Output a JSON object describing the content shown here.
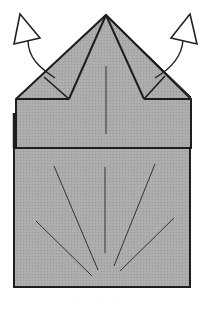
{
  "diagram": {
    "title": "",
    "colors": {
      "paper": "#a9a9a9",
      "outline": "#1e1e1e",
      "crease": "#333333",
      "arrow_fill": "#ffffff",
      "background": "#ffffff"
    },
    "elements": {
      "apex": [
        106,
        15
      ],
      "upper_band": {
        "x1": 16,
        "x2": 191,
        "y1": 99,
        "y2": 148
      },
      "lower_body": {
        "x1": 14,
        "x2": 190,
        "y1": 148,
        "y2": 287
      },
      "left_flap_fold_point": [
        69,
        99
      ],
      "right_flap_fold_point": [
        144,
        99
      ],
      "arrows": [
        {
          "id": "left",
          "direction": "up-left",
          "label": "fold flap outward"
        },
        {
          "id": "right",
          "direction": "up-right",
          "label": "fold flap outward"
        }
      ],
      "crease_lines_count": 5
    },
    "caption": "· · ·"
  }
}
